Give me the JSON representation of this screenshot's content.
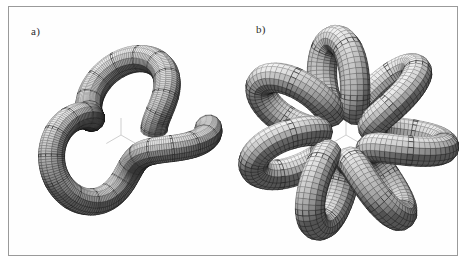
{
  "figure": {
    "background_color": "#ffffff",
    "frame_color": "#9a9a9a",
    "caption": ""
  },
  "panels": [
    {
      "id": "a",
      "label": "a)",
      "subject": "knotted-tube-torus-knot",
      "description": "Shaded wireframe tube forming a five-lobed knotted closed curve with self-crossings",
      "lobes": 5,
      "axis_indicator": "three-pronged-axis-tripod",
      "axis_color": "#c9c9c9",
      "tube_light_color": "#e8e8e8",
      "tube_dark_color": "#4a4a4a",
      "mesh_color": "#2e2e2e"
    },
    {
      "id": "b",
      "label": "b)",
      "subject": "flower-shaped-closed-tube",
      "description": "Shaded wireframe tube forming a seven-lobed unknotted flower-shaped closed curve",
      "lobes": 7,
      "axis_indicator": "three-pronged-axis-tripod",
      "axis_color": "#c9c9c9",
      "tube_light_color": "#e8e8e8",
      "tube_dark_color": "#4a4a4a",
      "mesh_color": "#2e2e2e"
    }
  ],
  "chart_data": {
    "type": "scatter",
    "title": "",
    "xlabel": "",
    "ylabel": "",
    "annotations": [
      "a)",
      "b)"
    ],
    "series": [
      {
        "name": "panel-a-knot-curve",
        "kind": "parametric-torus-knot",
        "p": 5,
        "q": 2,
        "lobes": 5,
        "center": [
          112,
          128
        ],
        "radius_outer": 92,
        "radius_inner": 34,
        "tube_radius": 13,
        "segments_along": 220,
        "segments_around": 14
      },
      {
        "name": "panel-b-flower-curve",
        "kind": "parametric-rose-loop",
        "p": 7,
        "q": 1,
        "lobes": 7,
        "center": [
          112,
          130
        ],
        "radius_outer": 96,
        "radius_inner": 40,
        "tube_radius": 14,
        "segments_along": 240,
        "segments_around": 14
      }
    ]
  }
}
